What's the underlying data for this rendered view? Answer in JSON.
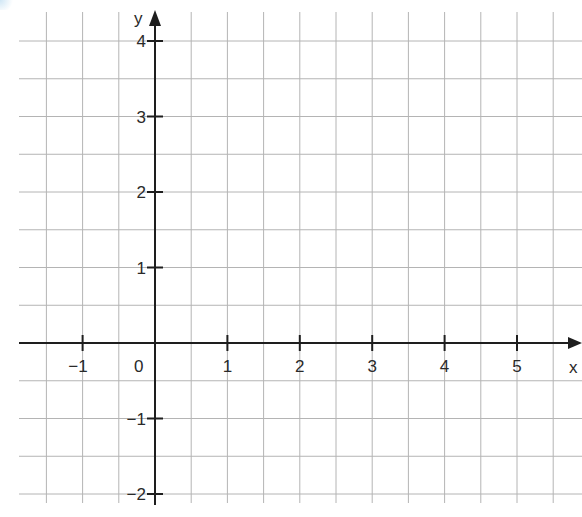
{
  "chart_data": {
    "type": "line",
    "title": "",
    "xlabel": "x",
    "ylabel": "y",
    "xlim": [
      -1.85,
      5.9
    ],
    "ylim": [
      -2.1,
      4.4
    ],
    "grid": true,
    "grid_step": 0.5,
    "x_ticks": [
      -1,
      1,
      2,
      3,
      4,
      5
    ],
    "y_ticks": [
      4,
      3,
      2,
      1,
      -1,
      -2
    ],
    "origin_label": "0",
    "series": []
  },
  "colors": {
    "grid": "#b4b4b4",
    "axis": "#1e1e1e",
    "label": "#2a2a2a",
    "background": "#ffffff"
  },
  "labels": {
    "x_axis": "x",
    "y_axis": "y",
    "origin": "0",
    "x_ticks": [
      "−1",
      "1",
      "2",
      "3",
      "4",
      "5"
    ],
    "y_ticks": [
      "4",
      "3",
      "2",
      "1",
      "−1",
      "−2"
    ]
  }
}
